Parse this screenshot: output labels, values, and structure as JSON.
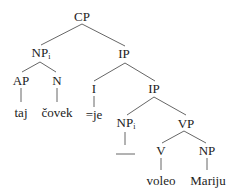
{
  "diagram": {
    "type": "syntax-tree",
    "nodes": [
      {
        "id": "cp",
        "label": "CP",
        "sub": "",
        "x": 82,
        "y": 16
      },
      {
        "id": "np-subj",
        "label": "NP",
        "sub": "i",
        "x": 41,
        "y": 53
      },
      {
        "id": "ip-top",
        "label": "IP",
        "sub": "",
        "x": 124,
        "y": 53
      },
      {
        "id": "ap",
        "label": "AP",
        "sub": "",
        "x": 21,
        "y": 80
      },
      {
        "id": "n",
        "label": "N",
        "sub": "",
        "x": 57,
        "y": 80
      },
      {
        "id": "i",
        "label": "I",
        "sub": "",
        "x": 94,
        "y": 88
      },
      {
        "id": "ip-low",
        "label": "IP",
        "sub": "",
        "x": 154,
        "y": 88
      },
      {
        "id": "np-trace",
        "label": "NP",
        "sub": "i",
        "x": 126,
        "y": 123
      },
      {
        "id": "vp",
        "label": "VP",
        "sub": "",
        "x": 186,
        "y": 123
      },
      {
        "id": "v",
        "label": "V",
        "sub": "",
        "x": 161,
        "y": 150
      },
      {
        "id": "np-obj",
        "label": "NP",
        "sub": "",
        "x": 207,
        "y": 150
      }
    ],
    "leaves": [
      {
        "id": "taj",
        "label": "taj",
        "x": 21,
        "y": 112
      },
      {
        "id": "covek",
        "label": "čovek",
        "x": 57,
        "y": 112
      },
      {
        "id": "je",
        "label": "=je",
        "x": 94,
        "y": 114
      },
      {
        "id": "voleo",
        "label": "voleo",
        "x": 161,
        "y": 180
      },
      {
        "id": "mariju",
        "label": "Mariju",
        "x": 208,
        "y": 180
      }
    ],
    "edges": [
      {
        "from": "cp",
        "x1": 82,
        "y1": 24,
        "x2": 41,
        "y2": 45
      },
      {
        "from": "cp",
        "x1": 82,
        "y1": 24,
        "x2": 125,
        "y2": 46
      },
      {
        "from": "np-subj",
        "x1": 40,
        "y1": 62,
        "x2": 22,
        "y2": 72
      },
      {
        "from": "np-subj",
        "x1": 40,
        "y1": 62,
        "x2": 56,
        "y2": 72
      },
      {
        "from": "ip-top",
        "x1": 125,
        "y1": 63,
        "x2": 94,
        "y2": 81
      },
      {
        "from": "ip-top",
        "x1": 125,
        "y1": 63,
        "x2": 155,
        "y2": 81
      },
      {
        "from": "ap",
        "x1": 21,
        "y1": 88,
        "x2": 21,
        "y2": 102
      },
      {
        "from": "n",
        "x1": 57,
        "y1": 88,
        "x2": 57,
        "y2": 102
      },
      {
        "from": "i",
        "x1": 94,
        "y1": 96,
        "x2": 94,
        "y2": 107
      },
      {
        "from": "ip-low",
        "x1": 154,
        "y1": 97,
        "x2": 127,
        "y2": 115
      },
      {
        "from": "ip-low",
        "x1": 154,
        "y1": 97,
        "x2": 186,
        "y2": 115
      },
      {
        "from": "np-trace",
        "x1": 125,
        "y1": 132,
        "x2": 125,
        "y2": 145
      },
      {
        "from": "vp",
        "x1": 184,
        "y1": 131,
        "x2": 162,
        "y2": 143
      },
      {
        "from": "vp",
        "x1": 184,
        "y1": 131,
        "x2": 206,
        "y2": 143
      },
      {
        "from": "v",
        "x1": 161,
        "y1": 158,
        "x2": 161,
        "y2": 170
      },
      {
        "from": "np-obj",
        "x1": 207,
        "y1": 158,
        "x2": 207,
        "y2": 170
      }
    ],
    "trace": {
      "x1": 116,
      "y1": 154,
      "x2": 135,
      "y2": 154
    }
  },
  "labels": {
    "cp": "CP",
    "np_subj": "NP",
    "np_subj_index": "i",
    "ip_top": "IP",
    "ap": "AP",
    "n": "N",
    "i": "I",
    "ip_low": "IP",
    "np_trace": "NP",
    "np_trace_index": "i",
    "vp": "VP",
    "v": "V",
    "np_obj": "NP",
    "taj": "taj",
    "covek": "čovek",
    "je": "=je",
    "voleo": "voleo",
    "mariju": "Mariju"
  }
}
